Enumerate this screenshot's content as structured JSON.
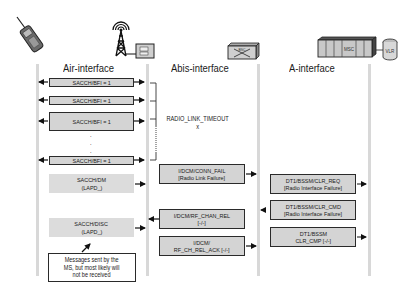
{
  "diagram": {
    "entities": [
      {
        "name": "MS",
        "icon": "mobile-phone-icon"
      },
      {
        "name": "BTS",
        "icon": "bts-tower-icon"
      },
      {
        "name": "BSC",
        "icon": "bsc-switch-icon",
        "label": "BSC"
      },
      {
        "name": "MSC",
        "icon": "msc-rack-icon",
        "label": "MSC"
      },
      {
        "name": "VLR",
        "icon": "vlr-database-icon",
        "label": "VLR"
      }
    ],
    "interfaces": [
      {
        "label": "Air-interface"
      },
      {
        "label": "Abis-interface"
      },
      {
        "label": "A-interface"
      }
    ],
    "air": {
      "sacch_bfi": [
        "SACCH/BFI = 1",
        "SACCH/BFI = 1",
        "SACCH/BFI = 1",
        "SACCH/BFI = 1"
      ],
      "ellipsis": ".",
      "dm": {
        "line1": "SACCH/DM",
        "line2": "(LAPD_)"
      },
      "disc": {
        "line1": "SACCH/DISC",
        "line2": "(LAPD_)"
      },
      "note": {
        "line1": "Messages sent by the",
        "line2": "MS, but most likely will",
        "line3": "not be received"
      }
    },
    "abis": {
      "timeout": {
        "line1": "RADIO_LINK_TIMEOUT",
        "line2": "x"
      },
      "conn_fail": {
        "line1": "I/DCM/CONN_FAIL",
        "line2": "[Radio Link Failure]"
      },
      "rf_chan_rel": {
        "line1": "I/DCM/RF_CHAN_REL",
        "line2": "[-/-]"
      },
      "rf_ch_rel_ack": {
        "line1": "I/DCM/",
        "line2": "RF_CH_REL_ACK [-/-]"
      }
    },
    "a": {
      "clr_req": {
        "line1": "DT1/BSSM/CLR_REQ",
        "line2": "[Radio Interface Failure]"
      },
      "clr_cmd": {
        "line1": "DT1/BSSM/CLR_CMD",
        "line2": "[Radio Interface Failure]"
      },
      "clr_cmp": {
        "line1": "DT1/BSSM",
        "line2": "CLR_CMP [-/-]"
      }
    },
    "colors": {
      "box_fill": "#d4d4d4",
      "border": "#2a2a2a",
      "lifeline": "#d8d8d8"
    }
  }
}
